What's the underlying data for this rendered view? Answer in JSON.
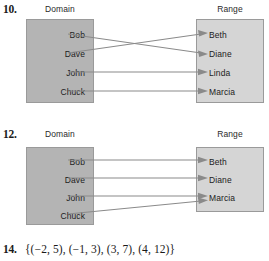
{
  "exercises": [
    {
      "number": "10.",
      "type": "mapping-diagram",
      "domain_header": "Domain",
      "range_header": "Range",
      "domain_items": [
        "Bob",
        "Dave",
        "John",
        "Chuck"
      ],
      "range_items": [
        "Beth",
        "Diane",
        "Linda",
        "Marcia"
      ],
      "mappings": [
        {
          "from": "Bob",
          "to": "Diane"
        },
        {
          "from": "Dave",
          "to": "Beth"
        },
        {
          "from": "John",
          "to": "Linda"
        },
        {
          "from": "Chuck",
          "to": "Marcia"
        }
      ]
    },
    {
      "number": "12.",
      "type": "mapping-diagram",
      "domain_header": "Domain",
      "range_header": "Range",
      "domain_items": [
        "Bob",
        "Dave",
        "John",
        "Chuck"
      ],
      "range_items": [
        "Beth",
        "Diane",
        "Marcia"
      ],
      "mappings": [
        {
          "from": "Bob",
          "to": "Beth"
        },
        {
          "from": "Dave",
          "to": "Diane"
        },
        {
          "from": "John",
          "to": "Marcia"
        },
        {
          "from": "Chuck",
          "to": "Marcia"
        }
      ]
    },
    {
      "number": "14.",
      "type": "set-notation",
      "text": "{(−2, 5), (−1, 3), (3, 7), (4, 12)}",
      "pairs": [
        [
          -2,
          5
        ],
        [
          -1,
          3
        ],
        [
          3,
          7
        ],
        [
          4,
          12
        ]
      ]
    }
  ],
  "colors": {
    "domain_fill": "#b4b4b4",
    "range_fill": "#d5d5d5",
    "box_border": "#9a9a9a",
    "arrow": "#8a8a8a",
    "text": "#1c1c1c"
  }
}
